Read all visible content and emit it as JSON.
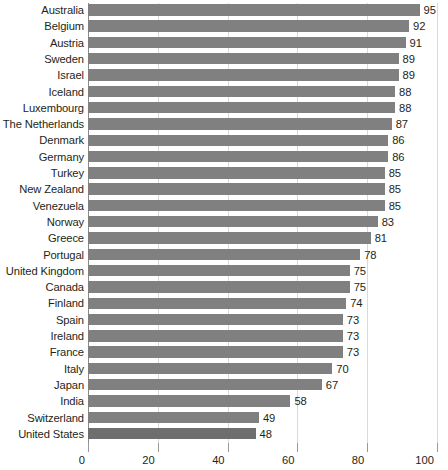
{
  "chart_data": {
    "type": "bar",
    "orientation": "horizontal",
    "title": "",
    "subtitle": "",
    "xlabel": "",
    "ylabel": "",
    "xlim": [
      0,
      100
    ],
    "xticks": [
      0,
      20,
      40,
      60,
      80,
      100
    ],
    "grid": true,
    "legend": null,
    "bar_color": "#808080",
    "highlight_color": "#6e6e6e",
    "highlight_category": "United States",
    "categories": [
      "Australia",
      "Belgium",
      "Austria",
      "Sweden",
      "Israel",
      "Iceland",
      "Luxembourg",
      "The Netherlands",
      "Denmark",
      "Germany",
      "Turkey",
      "New Zealand",
      "Venezuela",
      "Norway",
      "Greece",
      "Portugal",
      "United Kingdom",
      "Canada",
      "Finland",
      "Spain",
      "Ireland",
      "France",
      "Italy",
      "Japan",
      "India",
      "Switzerland",
      "United States"
    ],
    "values": [
      95,
      92,
      91,
      89,
      89,
      88,
      88,
      87,
      86,
      86,
      85,
      85,
      85,
      83,
      81,
      78,
      75,
      75,
      74,
      73,
      73,
      73,
      70,
      67,
      58,
      49,
      48
    ],
    "value_labels": [
      "95",
      "92",
      "91",
      "89",
      "89",
      "88",
      "88",
      "87",
      "86",
      "86",
      "85",
      "85",
      "85",
      "83",
      "81",
      "78",
      "75",
      "75",
      "74",
      "73",
      "73",
      "73",
      "70",
      "67",
      "58",
      "49",
      "48"
    ],
    "xtick_labels": [
      "0",
      "20",
      "40",
      "60",
      "80",
      "100"
    ]
  }
}
